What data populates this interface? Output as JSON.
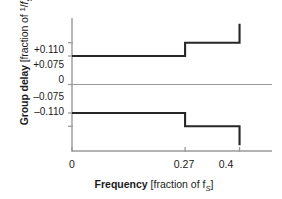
{
  "chart_data": {
    "type": "line",
    "title": "",
    "subtitle": "",
    "xlabel_bold": "Frequency",
    "xlabel_rest": " [fraction of f",
    "xlabel_sub": "S",
    "xlabel_close": "]",
    "ylabel_bold": "Group delay",
    "ylabel_rest": " [fraction of ",
    "ylabel_frac_num": "1",
    "ylabel_frac_slash": "/",
    "ylabel_frac_den": "f",
    "ylabel_frac_sub": "S",
    "ylabel_close": "]",
    "xlim": [
      0,
      0.4775
    ],
    "ylim": [
      -0.175,
      0.175
    ],
    "grid": false,
    "legend": "none",
    "xticks": [
      {
        "value": 0,
        "label": "0"
      },
      {
        "value": 0.27,
        "label": "0.27"
      },
      {
        "value": 0.4,
        "label": "0.4"
      }
    ],
    "yticks": [
      {
        "value": 0.11,
        "label": "+0.110"
      },
      {
        "value": 0.075,
        "label": "+0.075"
      },
      {
        "value": 0.0,
        "label": "0"
      },
      {
        "value": -0.075,
        "label": "–0.075"
      },
      {
        "value": -0.11,
        "label": "–0.110"
      }
    ],
    "zero_line": {
      "value": 0,
      "color": "#9a9a9a"
    },
    "series": [
      {
        "name": "upper-group-delay",
        "color": "#262626",
        "style": "step",
        "points": [
          {
            "x": 0.0,
            "y": 0.075
          },
          {
            "x": 0.27,
            "y": 0.075
          },
          {
            "x": 0.27,
            "y": 0.11
          },
          {
            "x": 0.4,
            "y": 0.11
          },
          {
            "x": 0.4,
            "y": 0.16
          }
        ]
      },
      {
        "name": "lower-group-delay",
        "color": "#262626",
        "style": "step",
        "points": [
          {
            "x": 0.0,
            "y": -0.075
          },
          {
            "x": 0.27,
            "y": -0.075
          },
          {
            "x": 0.27,
            "y": -0.11
          },
          {
            "x": 0.4,
            "y": -0.11
          },
          {
            "x": 0.4,
            "y": -0.16
          }
        ]
      }
    ],
    "axis_color": "#9a9a9a",
    "text_color": "#1a1a1a"
  }
}
